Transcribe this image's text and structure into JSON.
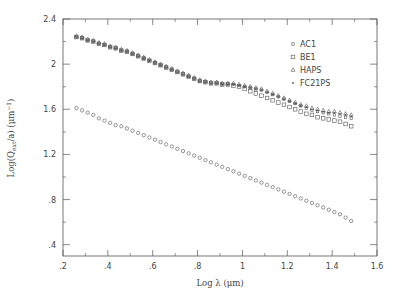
{
  "chart_data": {
    "type": "scatter",
    "title": "",
    "xlabel": "Log λ (μm)",
    "ylabel": "Log(Q_ext/a) (μm⁻¹)",
    "xlim": [
      0.2,
      1.6
    ],
    "ylim": [
      0.3,
      2.4
    ],
    "grid": false,
    "legend_position": "upper right",
    "x_ticks": [
      0.2,
      0.4,
      0.6,
      0.8,
      1.0,
      1.2,
      1.4,
      1.6
    ],
    "x_tick_labels": [
      ".2",
      ".4",
      ".6",
      ".8",
      "1",
      "1.2",
      "1.4",
      "1.6"
    ],
    "y_ticks": [
      0.4,
      0.8,
      1.2,
      1.6,
      2.0,
      2.4
    ],
    "y_tick_labels": [
      ".4",
      ".8",
      "1.2",
      "1.6",
      "2",
      "2.4"
    ],
    "x": [
      0.26,
      0.285,
      0.31,
      0.335,
      0.36,
      0.385,
      0.41,
      0.435,
      0.46,
      0.485,
      0.51,
      0.535,
      0.56,
      0.585,
      0.61,
      0.635,
      0.66,
      0.685,
      0.71,
      0.735,
      0.76,
      0.785,
      0.81,
      0.835,
      0.86,
      0.885,
      0.91,
      0.935,
      0.96,
      0.985,
      1.01,
      1.035,
      1.06,
      1.085,
      1.11,
      1.135,
      1.16,
      1.185,
      1.21,
      1.235,
      1.26,
      1.285,
      1.31,
      1.335,
      1.36,
      1.385,
      1.41,
      1.435,
      1.46,
      1.485
    ],
    "series": [
      {
        "name": "AC1",
        "marker": "square-small",
        "values": [
          2.24,
          2.23,
          2.21,
          2.2,
          2.18,
          2.17,
          2.15,
          2.14,
          2.12,
          2.11,
          2.09,
          2.07,
          2.05,
          2.03,
          2.01,
          1.99,
          1.97,
          1.95,
          1.93,
          1.91,
          1.89,
          1.87,
          1.85,
          1.84,
          1.83,
          1.83,
          1.82,
          1.82,
          1.82,
          1.81,
          1.8,
          1.79,
          1.78,
          1.77,
          1.75,
          1.73,
          1.71,
          1.69,
          1.67,
          1.65,
          1.63,
          1.61,
          1.59,
          1.58,
          1.57,
          1.56,
          1.55,
          1.54,
          1.53,
          1.52
        ]
      },
      {
        "name": "BE1",
        "marker": "square",
        "values": [
          2.24,
          2.23,
          2.21,
          2.2,
          2.18,
          2.17,
          2.15,
          2.14,
          2.12,
          2.11,
          2.09,
          2.07,
          2.05,
          2.03,
          2.01,
          1.99,
          1.97,
          1.95,
          1.93,
          1.91,
          1.89,
          1.87,
          1.85,
          1.84,
          1.83,
          1.83,
          1.82,
          1.82,
          1.81,
          1.8,
          1.78,
          1.76,
          1.74,
          1.72,
          1.7,
          1.68,
          1.66,
          1.64,
          1.62,
          1.6,
          1.58,
          1.56,
          1.55,
          1.53,
          1.52,
          1.51,
          1.5,
          1.49,
          1.47,
          1.45
        ]
      },
      {
        "name": "HAPS",
        "marker": "triangle",
        "values": [
          2.25,
          2.24,
          2.22,
          2.21,
          2.19,
          2.18,
          2.16,
          2.15,
          2.13,
          2.12,
          2.1,
          2.08,
          2.06,
          2.04,
          2.02,
          2.0,
          1.98,
          1.96,
          1.94,
          1.92,
          1.9,
          1.88,
          1.86,
          1.85,
          1.84,
          1.84,
          1.83,
          1.83,
          1.83,
          1.82,
          1.81,
          1.8,
          1.79,
          1.78,
          1.76,
          1.74,
          1.72,
          1.7,
          1.68,
          1.66,
          1.64,
          1.63,
          1.61,
          1.6,
          1.59,
          1.58,
          1.58,
          1.57,
          1.56,
          1.55
        ]
      },
      {
        "name": "FC21PS",
        "marker": "dot",
        "values": [
          2.24,
          2.23,
          2.21,
          2.2,
          2.18,
          2.17,
          2.15,
          2.14,
          2.12,
          2.11,
          2.09,
          2.07,
          2.05,
          2.03,
          2.01,
          1.99,
          1.97,
          1.95,
          1.93,
          1.91,
          1.89,
          1.87,
          1.85,
          1.84,
          1.83,
          1.83,
          1.82,
          1.82,
          1.82,
          1.81,
          1.8,
          1.79,
          1.78,
          1.77,
          1.75,
          1.73,
          1.71,
          1.69,
          1.67,
          1.65,
          1.63,
          1.62,
          1.6,
          1.59,
          1.58,
          1.57,
          1.57,
          1.56,
          1.55,
          1.54
        ]
      },
      {
        "name": "lower-series",
        "marker": "circle",
        "values": [
          1.61,
          1.59,
          1.57,
          1.55,
          1.52,
          1.5,
          1.48,
          1.46,
          1.45,
          1.43,
          1.41,
          1.39,
          1.37,
          1.35,
          1.33,
          1.31,
          1.29,
          1.27,
          1.25,
          1.23,
          1.21,
          1.19,
          1.17,
          1.15,
          1.13,
          1.11,
          1.09,
          1.07,
          1.05,
          1.03,
          1.01,
          0.99,
          0.97,
          0.95,
          0.93,
          0.91,
          0.89,
          0.87,
          0.85,
          0.83,
          0.81,
          0.79,
          0.77,
          0.75,
          0.73,
          0.71,
          0.69,
          0.67,
          0.64,
          0.61
        ]
      }
    ],
    "legend": [
      "AC1",
      "BE1",
      "HAPS",
      "FC21PS"
    ]
  },
  "labels": {
    "xlabel": "Log λ (μm)",
    "ylabel_main": "Log(Q",
    "ylabel_sub": "ext",
    "ylabel_rest": "/a) (μm",
    "ylabel_sup": "−1",
    "ylabel_close": ")"
  },
  "legend_items": [
    {
      "label": "AC1",
      "marker": "square-small"
    },
    {
      "label": "BE1",
      "marker": "square"
    },
    {
      "label": "HAPS",
      "marker": "triangle"
    },
    {
      "label": "FC21PS",
      "marker": "dot"
    }
  ]
}
